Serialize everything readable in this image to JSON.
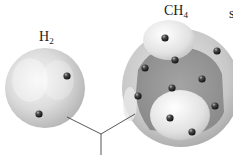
{
  "diagram": {
    "type": "molecular electron-cloud comparison",
    "molecules": [
      {
        "id": "h2",
        "formula_base": "H",
        "formula_sub": "2",
        "label": "H2",
        "sphere": {
          "cx": 45,
          "cy": 88,
          "r": 40
        },
        "electrons": [
          {
            "x": 67,
            "y": 76
          },
          {
            "x": 39,
            "y": 114
          }
        ]
      },
      {
        "id": "ch4",
        "formula_base": "CH",
        "formula_sub": "4",
        "label": "CH4",
        "sphere": {
          "cx": 181,
          "cy": 88,
          "r": 59
        },
        "electrons": [
          {
            "x": 165,
            "y": 38
          },
          {
            "x": 217,
            "y": 51
          },
          {
            "x": 175,
            "y": 60
          },
          {
            "x": 145,
            "y": 68
          },
          {
            "x": 202,
            "y": 79
          },
          {
            "x": 172,
            "y": 88
          },
          {
            "x": 138,
            "y": 96
          },
          {
            "x": 215,
            "y": 106
          },
          {
            "x": 170,
            "y": 118
          },
          {
            "x": 192,
            "y": 132
          }
        ]
      }
    ],
    "edge_glyph": "s",
    "connector": {
      "left_end": {
        "x": 67,
        "y": 117
      },
      "right_end": {
        "x": 135,
        "y": 114
      },
      "junction": {
        "x": 101,
        "y": 134
      },
      "stem_end": {
        "x": 101,
        "y": 155
      }
    },
    "colors": {
      "background": "#ffffff",
      "sphere_light": "#f2f2f2",
      "sphere_mid": "#d0d0d0",
      "sphere_dark": "#a8a8a8",
      "inner_cavity": "#9c9c9c",
      "electron": "#2a2a2a",
      "line": "#444444",
      "text": "#222222"
    }
  }
}
